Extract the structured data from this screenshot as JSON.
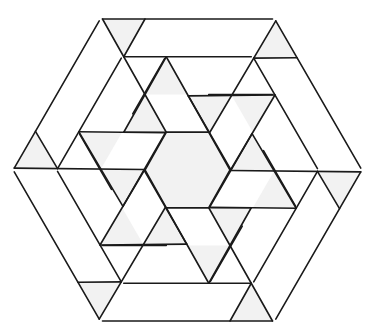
{
  "figure": {
    "width": 380,
    "height": 336,
    "center": [
      187.5,
      170
    ],
    "rotations": 6,
    "colors": {
      "background": "#ffffff",
      "stroke": "#1a1a1a",
      "shade": "#f2f2f2"
    },
    "stroke_width": 1.6,
    "central_hexagon": [
      [
        -21.25,
        -37.75
      ],
      [
        21.25,
        -37.75
      ],
      [
        42.5,
        0
      ],
      [
        21.25,
        37.75
      ],
      [
        -21.25,
        37.75
      ],
      [
        -42.5,
        0
      ]
    ],
    "sector_segments": [
      [
        [
          -85,
          -151
        ],
        [
          85,
          -151
        ]
      ],
      [
        [
          -85,
          -151
        ],
        [
          -21.25,
          -37.75
        ]
      ],
      [
        [
          -42.5,
          -151
        ],
        [
          -63.75,
          -113.25
        ]
      ],
      [
        [
          -63.75,
          -113.25
        ],
        [
          63.75,
          -113.25
        ]
      ],
      [
        [
          -21.25,
          -113.25
        ],
        [
          -63.75,
          -37.75
        ]
      ],
      [
        [
          -21.25,
          -113.25
        ],
        [
          21.25,
          -37.75
        ]
      ],
      [
        [
          21.25,
          -75.5
        ],
        [
          85,
          -75.5
        ]
      ],
      [
        [
          -63.75,
          -37.75
        ],
        [
          21.25,
          -37.75
        ]
      ]
    ],
    "sector_shaded": [
      [
        [
          -85,
          -151
        ],
        [
          -42.5,
          -151
        ],
        [
          -63.75,
          -113.25
        ]
      ],
      [
        [
          -42.5,
          -75.5
        ],
        [
          -63.75,
          -37.75
        ],
        [
          -21.25,
          -37.75
        ]
      ],
      [
        [
          -21.25,
          -113.25
        ],
        [
          0,
          -75.5
        ],
        [
          -42.5,
          -75.5
        ]
      ]
    ]
  }
}
